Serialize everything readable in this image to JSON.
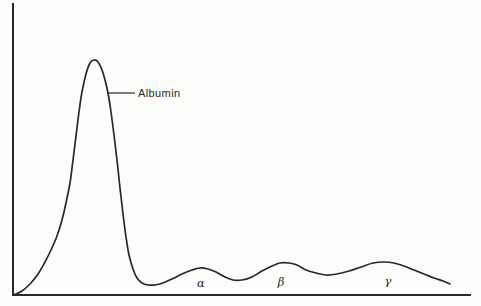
{
  "figure": {
    "width": 481,
    "height": 306,
    "background": "#fcfcfa",
    "ink_color": "#282828"
  },
  "chart_data": {
    "type": "line",
    "title": "",
    "xlabel": "",
    "ylabel": "",
    "grid": false,
    "legend": null,
    "units": "screen pixels, y increases downward, baseline at y=295",
    "x_axis": {
      "ticks": [],
      "line": {
        "x1": 13,
        "y1": 295,
        "x2": 470,
        "y2": 295
      }
    },
    "y_axis": {
      "ticks": [],
      "line": {
        "x1": 13,
        "y1": 4,
        "x2": 13,
        "y2": 295
      }
    },
    "series": [
      {
        "name": "densitometer trace",
        "points": [
          [
            14,
            295
          ],
          [
            22,
            291
          ],
          [
            30,
            284
          ],
          [
            38,
            274
          ],
          [
            45,
            262
          ],
          [
            51,
            250
          ],
          [
            57,
            236
          ],
          [
            62,
            220
          ],
          [
            66,
            203
          ],
          [
            70,
            183
          ],
          [
            73,
            160
          ],
          [
            76,
            136
          ],
          [
            79,
            112
          ],
          [
            82,
            92
          ],
          [
            86,
            74
          ],
          [
            90,
            63
          ],
          [
            94,
            60
          ],
          [
            98,
            62
          ],
          [
            102,
            70
          ],
          [
            105,
            80
          ],
          [
            108,
            93
          ],
          [
            111,
            112
          ],
          [
            114,
            135
          ],
          [
            117,
            160
          ],
          [
            120,
            188
          ],
          [
            123,
            214
          ],
          [
            126,
            237
          ],
          [
            129,
            255
          ],
          [
            133,
            269
          ],
          [
            137,
            278
          ],
          [
            142,
            283
          ],
          [
            148,
            285
          ],
          [
            155,
            285
          ],
          [
            163,
            283
          ],
          [
            172,
            279
          ],
          [
            182,
            274
          ],
          [
            192,
            270
          ],
          [
            200,
            268
          ],
          [
            208,
            269
          ],
          [
            216,
            272
          ],
          [
            225,
            277
          ],
          [
            233,
            280
          ],
          [
            242,
            280
          ],
          [
            252,
            277
          ],
          [
            262,
            271
          ],
          [
            272,
            266
          ],
          [
            280,
            263
          ],
          [
            289,
            263
          ],
          [
            297,
            265
          ],
          [
            306,
            270
          ],
          [
            316,
            273
          ],
          [
            326,
            275
          ],
          [
            337,
            274
          ],
          [
            349,
            271
          ],
          [
            361,
            267
          ],
          [
            373,
            263
          ],
          [
            384,
            262
          ],
          [
            394,
            263
          ],
          [
            404,
            266
          ],
          [
            414,
            270
          ],
          [
            424,
            274
          ],
          [
            434,
            278
          ],
          [
            443,
            281
          ],
          [
            450,
            284
          ]
        ]
      }
    ],
    "peaks": [
      {
        "label": "Albumin",
        "apex_px": [
          94,
          60
        ],
        "relative_height": 1.0
      },
      {
        "label": "α",
        "apex_px": [
          201,
          268
        ],
        "relative_height": 0.115
      },
      {
        "label": "β",
        "apex_px": [
          281,
          263
        ],
        "relative_height": 0.137
      },
      {
        "label": "γ",
        "apex_px": [
          385,
          262
        ],
        "relative_height": 0.141
      }
    ],
    "annotations": [
      {
        "name": "albumin",
        "label": "Albumin",
        "x": 138,
        "y": 93,
        "anchor": "left-middle",
        "leader_line": {
          "x1": 108,
          "y1": 93,
          "x2": 135,
          "y2": 93
        }
      },
      {
        "name": "alpha",
        "label": "α",
        "x": 201,
        "y": 283,
        "anchor": "center"
      },
      {
        "name": "beta",
        "label": "β",
        "x": 281,
        "y": 282,
        "anchor": "center"
      },
      {
        "name": "gamma",
        "label": "γ",
        "x": 388,
        "y": 281,
        "anchor": "center"
      }
    ]
  }
}
